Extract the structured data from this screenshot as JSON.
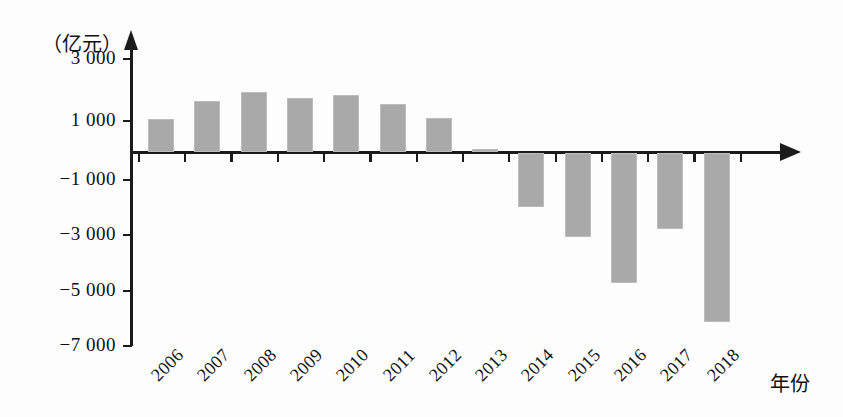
{
  "chart_data": {
    "type": "bar",
    "title": "",
    "subtitle": "",
    "xlabel": "年份",
    "ylabel": "（亿元）",
    "unit_label": "（亿元）",
    "categories": [
      "2006",
      "2007",
      "2008",
      "2009",
      "2010",
      "2011",
      "2012",
      "2013",
      "2014",
      "2015",
      "2016",
      "2017",
      "2018"
    ],
    "values": [
      1050,
      1650,
      1950,
      1750,
      1850,
      1550,
      1100,
      100,
      -1950,
      -3050,
      -4700,
      -2750,
      -6100
    ],
    "series": [
      {
        "name": "",
        "values": [
          1050,
          1650,
          1950,
          1750,
          1850,
          1550,
          1100,
          100,
          -1950,
          -3050,
          -4700,
          -2750,
          -6100
        ]
      }
    ],
    "ylim": [
      -7000,
      3000
    ],
    "ytick_values": [
      3000,
      1000,
      -1000,
      -3000,
      -5000,
      -7000
    ],
    "ytick_labels": [
      "3 000",
      "1 000",
      "−1 000",
      "−3 000",
      "−5 000",
      "−7 000"
    ],
    "grid": false,
    "legend": false,
    "legend_position": "none",
    "bar_color": "#a9a9a9",
    "axis_color": "#1b1b1b",
    "background_color": "#fdfdfd",
    "x_tick_rotation": -45
  },
  "axis": {
    "y_arrow_icon": "arrow-up-icon",
    "x_arrow_icon": "arrow-right-icon"
  }
}
